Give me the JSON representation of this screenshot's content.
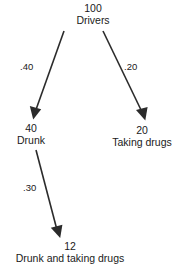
{
  "diagram": {
    "type": "probability-tree",
    "title": "",
    "background_color": "#ffffff",
    "line_color": "#2b2b2b",
    "text_color": "#1a1a1a",
    "nodes": [
      {
        "id": "drivers",
        "count": "100",
        "label": "Drivers"
      },
      {
        "id": "drunk",
        "count": "40",
        "label": "Drunk"
      },
      {
        "id": "taking_drugs",
        "count": "20",
        "label": "Taking drugs"
      },
      {
        "id": "both",
        "count": "12",
        "label": "Drunk and taking drugs"
      }
    ],
    "edges": [
      {
        "id": "drivers_drunk",
        "from": "drivers",
        "to": "drunk",
        "probability": ".40"
      },
      {
        "id": "drivers_taking_drugs",
        "from": "drivers",
        "to": "taking_drugs",
        "probability": ".20"
      },
      {
        "id": "drunk_both",
        "from": "drunk",
        "to": "both",
        "probability": ".30"
      }
    ]
  }
}
